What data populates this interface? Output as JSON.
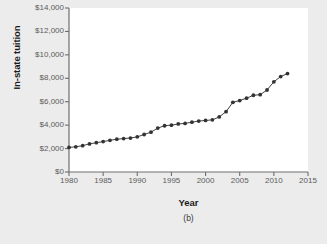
{
  "figure": {
    "background_color": "#ececec",
    "panel_color": "#ffffff",
    "subcaption": "(b)"
  },
  "chart_data": {
    "type": "line",
    "title": "",
    "xlabel": "Year",
    "ylabel": "In-state tuition",
    "xlim": [
      1980,
      2015
    ],
    "ylim": [
      0,
      14000
    ],
    "grid": false,
    "legend": "none",
    "marker": "filled-circle",
    "marker_color": "#333333",
    "line_color": "#444444",
    "xtick_labels": [
      "1980",
      "1985",
      "1990",
      "1995",
      "2000",
      "2005",
      "2010",
      "2015"
    ],
    "xticks": [
      1980,
      1985,
      1990,
      1995,
      2000,
      2005,
      2010,
      2015
    ],
    "ytick_labels": [
      "$0",
      "$2,000",
      "$4,000",
      "$6,000",
      "$8,000",
      "$10,000",
      "$12,000",
      "$14,000"
    ],
    "yticks": [
      0,
      2000,
      4000,
      6000,
      8000,
      10000,
      12000,
      14000
    ],
    "x": [
      1980,
      1981,
      1982,
      1983,
      1984,
      1985,
      1986,
      1987,
      1988,
      1989,
      1990,
      1991,
      1992,
      1993,
      1994,
      1995,
      1996,
      1997,
      1998,
      1999,
      2000,
      2001,
      2002,
      2003,
      2004,
      2005,
      2006,
      2007,
      2008,
      2009,
      2010,
      2011,
      2012
    ],
    "values": [
      2100,
      2150,
      2250,
      2400,
      2500,
      2600,
      2700,
      2800,
      2850,
      2900,
      3000,
      3200,
      3400,
      3750,
      3950,
      4000,
      4100,
      4150,
      4250,
      4350,
      4400,
      4450,
      4700,
      5150,
      5950,
      6100,
      6300,
      6550,
      6600,
      7000,
      7700,
      8150,
      8400
    ]
  }
}
